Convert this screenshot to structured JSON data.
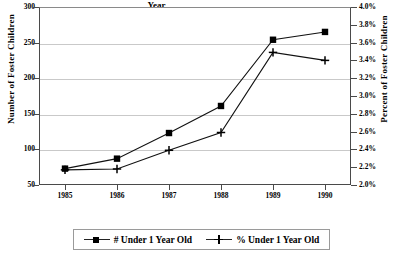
{
  "chart_data": {
    "type": "line",
    "title": "",
    "xlabel": "Year",
    "ylabel": "Number of Foster Children",
    "ylabel_right": "Percent of Foster Children",
    "categories": [
      "1985",
      "1986",
      "1987",
      "1988",
      "1989",
      "1990"
    ],
    "x": [
      1985,
      1986,
      1987,
      1988,
      1989,
      1990
    ],
    "ylim": [
      50,
      300
    ],
    "ylim_right": [
      2.0,
      4.0
    ],
    "yticks": [
      "50",
      "100",
      "150",
      "200",
      "250",
      "300"
    ],
    "ytick_values": [
      50,
      100,
      150,
      200,
      250,
      300
    ],
    "yticks_right": [
      "2.0%",
      "2.2%",
      "2.4%",
      "2.6%",
      "2.8%",
      "3.0%",
      "3.2%",
      "3.4%",
      "3.6%",
      "3.8%",
      "4.0%"
    ],
    "ytick_right_values": [
      2.0,
      2.2,
      2.4,
      2.6,
      2.8,
      3.0,
      3.2,
      3.4,
      3.6,
      3.8,
      4.0
    ],
    "grid": true,
    "legend_position": "bottom",
    "series": [
      {
        "name": "# Under 1 Year Old",
        "axis": "left",
        "marker": "square",
        "values": [
          73,
          87,
          123,
          161,
          254,
          265
        ]
      },
      {
        "name": "% Under 1 Year Old",
        "axis": "right",
        "marker": "plus",
        "values": [
          2.17,
          2.18,
          2.39,
          2.59,
          3.49,
          3.4
        ]
      }
    ]
  },
  "legend": {
    "items": [
      {
        "label": "# Under 1 Year Old",
        "marker": "square"
      },
      {
        "label": "% Under 1 Year Old",
        "marker": "plus"
      }
    ]
  },
  "colors": {
    "series": "#000000",
    "grid": "#c9c9c9",
    "axis": "#4a4a4a",
    "background": "#ffffff"
  }
}
